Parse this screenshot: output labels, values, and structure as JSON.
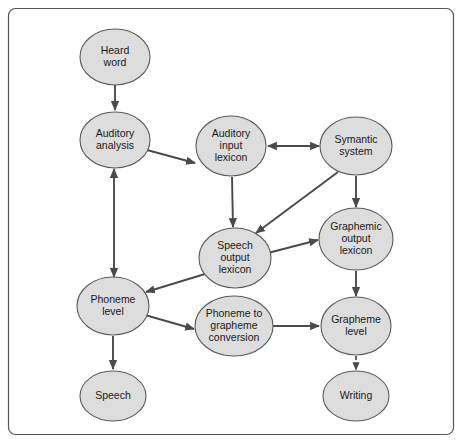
{
  "figure": {
    "frame": {
      "stroke_color": "#555555"
    },
    "node_fill_color": "#dddddd",
    "node_stroke_color": "#5a5a5a",
    "edge_color": "#4a4a4a",
    "background_color": "#ffffff"
  },
  "chart_data": {
    "type": "diagram",
    "title": "",
    "nodes": [
      {
        "id": "heard_word",
        "label": "Heard word",
        "lines": [
          "Heard",
          "word"
        ],
        "cx": 115,
        "cy": 57,
        "rx": 35,
        "ry": 28
      },
      {
        "id": "auditory_analysis",
        "label": "Auditory analysis",
        "lines": [
          "Auditory",
          "analysis"
        ],
        "cx": 115,
        "cy": 140,
        "rx": 35,
        "ry": 28
      },
      {
        "id": "auditory_input_lexicon",
        "label": "Auditory input lexicon",
        "lines": [
          "Auditory",
          "input",
          "lexicon"
        ],
        "cx": 231,
        "cy": 146,
        "rx": 35,
        "ry": 30
      },
      {
        "id": "symantic_system",
        "label": "Symantic system",
        "lines": [
          "Symantic",
          "system"
        ],
        "cx": 356,
        "cy": 146,
        "rx": 36,
        "ry": 29
      },
      {
        "id": "graphemic_output_lexicon",
        "label": "Graphemic output lexicon",
        "lines": [
          "Graphemic",
          "output",
          "lexicon"
        ],
        "cx": 356,
        "cy": 239,
        "rx": 37,
        "ry": 31
      },
      {
        "id": "speech_output_lexicon",
        "label": "Speech output lexicon",
        "lines": [
          "Speech",
          "output",
          "lexicon"
        ],
        "cx": 235,
        "cy": 258,
        "rx": 36,
        "ry": 30
      },
      {
        "id": "phoneme_level",
        "label": "Phoneme level",
        "lines": [
          "Phoneme",
          "level"
        ],
        "cx": 113,
        "cy": 306,
        "rx": 36,
        "ry": 29
      },
      {
        "id": "phoneme_to_grapheme",
        "label": "Phoneme to grapheme conversion",
        "lines": [
          "Phoneme to",
          "grapheme",
          "conversion"
        ],
        "cx": 234,
        "cy": 326,
        "rx": 39,
        "ry": 30
      },
      {
        "id": "grapheme_level",
        "label": "Grapheme level",
        "lines": [
          "Grapheme",
          "level"
        ],
        "cx": 356,
        "cy": 326,
        "rx": 35,
        "ry": 29
      },
      {
        "id": "speech",
        "label": "Speech",
        "lines": [
          "Speech"
        ],
        "cx": 113,
        "cy": 396,
        "rx": 33,
        "ry": 25
      },
      {
        "id": "writing",
        "label": "Writing",
        "lines": [
          "Writing"
        ],
        "cx": 356,
        "cy": 396,
        "rx": 33,
        "ry": 25
      }
    ],
    "edges": [
      {
        "from": "heard_word",
        "to": "auditory_analysis",
        "style": "solid",
        "direction": "forward",
        "x1": 115,
        "y1": 85,
        "x2": 115,
        "y2": 110
      },
      {
        "from": "auditory_analysis",
        "to": "auditory_input_lexicon",
        "style": "solid",
        "direction": "forward",
        "x1": 147,
        "y1": 150,
        "x2": 195,
        "y2": 163
      },
      {
        "from": "auditory_input_lexicon",
        "to": "symantic_system",
        "style": "solid",
        "direction": "bidirectional",
        "x1": 268,
        "y1": 146,
        "x2": 319,
        "y2": 146
      },
      {
        "from": "auditory_analysis",
        "to": "phoneme_level",
        "style": "solid",
        "direction": "bidirectional",
        "x1": 114,
        "y1": 169,
        "x2": 114,
        "y2": 277
      },
      {
        "from": "auditory_input_lexicon",
        "to": "speech_output_lexicon",
        "style": "solid",
        "direction": "forward",
        "x1": 232,
        "y1": 177,
        "x2": 233,
        "y2": 227
      },
      {
        "from": "symantic_system",
        "to": "speech_output_lexicon",
        "style": "solid",
        "direction": "forward",
        "x1": 338,
        "y1": 172,
        "x2": 256,
        "y2": 233
      },
      {
        "from": "symantic_system",
        "to": "graphemic_output_lexicon",
        "style": "solid",
        "direction": "forward",
        "x1": 356,
        "y1": 176,
        "x2": 356,
        "y2": 207
      },
      {
        "from": "speech_output_lexicon",
        "to": "graphemic_output_lexicon",
        "style": "solid",
        "direction": "forward",
        "x1": 268,
        "y1": 253,
        "x2": 318,
        "y2": 240
      },
      {
        "from": "speech_output_lexicon",
        "to": "phoneme_level",
        "style": "solid",
        "direction": "forward",
        "x1": 205,
        "y1": 274,
        "x2": 146,
        "y2": 292
      },
      {
        "from": "graphemic_output_lexicon",
        "to": "grapheme_level",
        "style": "solid",
        "direction": "forward",
        "x1": 356,
        "y1": 271,
        "x2": 356,
        "y2": 296
      },
      {
        "from": "phoneme_level",
        "to": "phoneme_to_grapheme",
        "style": "solid",
        "direction": "forward",
        "x1": 145,
        "y1": 315,
        "x2": 194,
        "y2": 329
      },
      {
        "from": "phoneme_to_grapheme",
        "to": "grapheme_level",
        "style": "solid",
        "direction": "forward",
        "x1": 273,
        "y1": 326,
        "x2": 319,
        "y2": 326
      },
      {
        "from": "phoneme_level",
        "to": "speech",
        "style": "solid",
        "direction": "forward",
        "x1": 113,
        "y1": 336,
        "x2": 113,
        "y2": 369
      },
      {
        "from": "grapheme_level",
        "to": "writing",
        "style": "dashed",
        "direction": "forward",
        "x1": 356,
        "y1": 356,
        "x2": 356,
        "y2": 370
      }
    ]
  }
}
